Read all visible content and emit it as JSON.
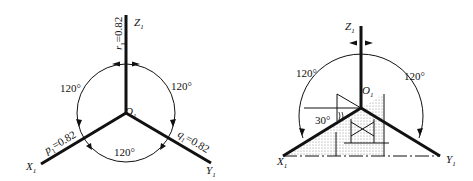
{
  "left_diagram": {
    "origin": "O",
    "origin_sub": "1",
    "axes": {
      "z": {
        "label": "Z",
        "sub": "1",
        "coef_letter": "r",
        "coef_sub": "1",
        "coef_value": "=0.82"
      },
      "x": {
        "label": "X",
        "sub": "1",
        "coef_letter": "p",
        "coef_sub": "1",
        "coef_value": "=0.82"
      },
      "y": {
        "label": "Y",
        "sub": "1",
        "coef_letter": "q",
        "coef_sub": "1",
        "coef_value": "=0.82"
      }
    },
    "angles": {
      "upper_left": "120°",
      "upper_right": "120°",
      "bottom": "120°"
    }
  },
  "right_diagram": {
    "origin": "O",
    "origin_sub": "1",
    "axes": {
      "z": {
        "label": "Z",
        "sub": "1"
      },
      "x": {
        "label": "X",
        "sub": "1"
      },
      "y": {
        "label": "Y",
        "sub": "1"
      }
    },
    "angles": {
      "upper_left": "120°",
      "upper_right": "120°",
      "tilt": "30°"
    }
  },
  "colors": {
    "line": "#111111",
    "fill_dots": "#888888"
  }
}
